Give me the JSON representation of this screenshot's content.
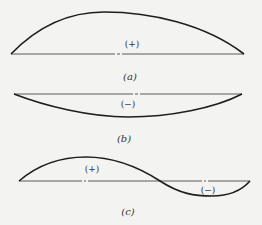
{
  "figure": {
    "panels": [
      {
        "id": "a",
        "caption": "(a)",
        "shape": "single arch above baseline",
        "regions": [
          {
            "sign": "positive",
            "label": "(+)"
          }
        ]
      },
      {
        "id": "b",
        "caption": "(b)",
        "shape": "single sag below baseline",
        "regions": [
          {
            "sign": "negative",
            "label": "(−)"
          }
        ]
      },
      {
        "id": "c",
        "caption": "(c)",
        "shape": "S-curve: hump above then dip below baseline",
        "regions": [
          {
            "sign": "positive",
            "label": "(+)"
          },
          {
            "sign": "negative",
            "label": "(−)"
          }
        ]
      }
    ]
  },
  "colors": {
    "background": "#f3f3f1",
    "curve": "#1e1e1e",
    "baseline": "#5a5a5a",
    "text": "#333333"
  }
}
